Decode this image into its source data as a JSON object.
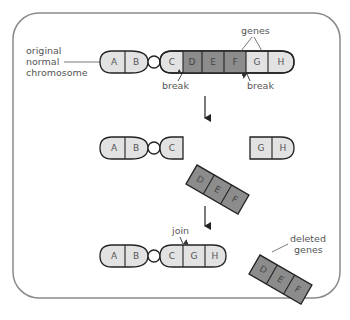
{
  "labels": {
    "original_chromosome": [
      "original",
      "normal",
      "chromosome"
    ],
    "genes": "genes",
    "break_left": "break",
    "break_right": "break",
    "join": "join",
    "deleted_genes": [
      "deleted",
      "genes"
    ]
  },
  "stage1": {
    "genes": [
      "A",
      "B",
      "C",
      "D",
      "E",
      "F",
      "G",
      "H"
    ]
  },
  "stage2": {
    "left_fragment": [
      "A",
      "B",
      "C"
    ],
    "deleted_fragment": [
      "D",
      "E",
      "F"
    ],
    "right_fragment": [
      "G",
      "H"
    ]
  },
  "stage3": {
    "joined_chromosome": [
      "A",
      "B",
      "C",
      "G",
      "H"
    ],
    "deleted_fragment": [
      "D",
      "E",
      "F"
    ]
  },
  "colors": {
    "light_gene": "#e2e2e2",
    "dark_gene": "#8c8c8c",
    "outline": "#222222",
    "frame": "#8a8a8a",
    "text": "#555555"
  }
}
